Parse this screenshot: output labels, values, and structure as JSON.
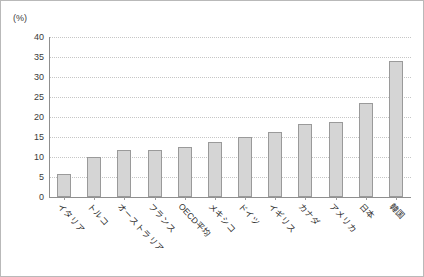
{
  "chart_data": {
    "type": "bar",
    "title": "",
    "subtitle": "",
    "xlabel": "",
    "ylabel": "",
    "unit_label": "(%)",
    "ylim": [
      0,
      40
    ],
    "ytick_step": 5,
    "ytick_labels": [
      "40",
      "35",
      "30",
      "25",
      "20",
      "15",
      "10",
      "5",
      "0"
    ],
    "ytick_values": [
      40,
      35,
      30,
      25,
      20,
      15,
      10,
      5,
      0
    ],
    "grid": true,
    "grid_style": "dotted-horizontal",
    "legend": false,
    "legend_position": "none",
    "bar_fill_color": "#d5d5d5",
    "bar_border_color": "#9a9a9a",
    "axis_color": "#8f8f8f",
    "grid_color": "#c6c6c6",
    "categories": [
      "イタリア",
      "トルコ",
      "オーストラリア",
      "フランス",
      "OECD平均",
      "メキシコ",
      "ドイツ",
      "イギリス",
      "カナダ",
      "アメリカ",
      "日本",
      "韓国"
    ],
    "values": [
      5.7,
      10.0,
      11.8,
      11.8,
      12.5,
      13.8,
      15.1,
      16.2,
      18.3,
      18.8,
      23.5,
      34.0
    ]
  }
}
